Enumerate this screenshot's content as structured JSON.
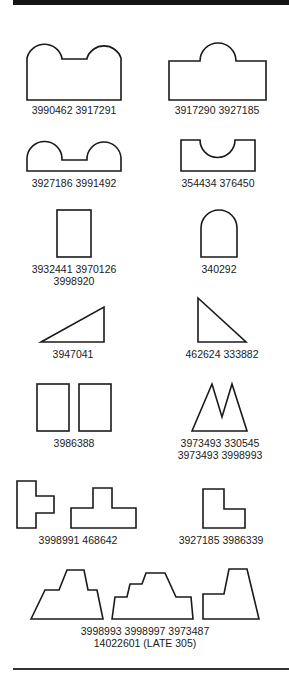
{
  "items": [
    {
      "shape": "double-bump-block",
      "lines": [
        "3990462 3917291"
      ]
    },
    {
      "shape": "single-bump-block",
      "lines": [
        "3917290 3927185"
      ]
    },
    {
      "shape": "double-bump-low",
      "lines": [
        "3927186 3991492"
      ]
    },
    {
      "shape": "notched-block",
      "lines": [
        "354434 376450"
      ]
    },
    {
      "shape": "tall-rectangle",
      "lines": [
        "3932441 3970126",
        "3998920"
      ]
    },
    {
      "shape": "arch",
      "lines": [
        "340292"
      ]
    },
    {
      "shape": "right-triangle-left",
      "lines": [
        "3947041"
      ]
    },
    {
      "shape": "right-triangle-right",
      "lines": [
        "462624 333882"
      ]
    },
    {
      "shape": "twin-rectangles",
      "lines": [
        "3986388"
      ]
    },
    {
      "shape": "twin-peaks",
      "lines": [
        "3973493 330545",
        "3973493 3998993"
      ]
    },
    {
      "shape": "t-blocks",
      "lines": [
        "3998991 468642"
      ]
    },
    {
      "shape": "l-block",
      "lines": [
        "3927185 3986339"
      ]
    },
    {
      "shape": "stepped-pyramids",
      "lines": [
        "3998993 3998997 3973487",
        "14022601 (LATE 305)"
      ]
    }
  ]
}
